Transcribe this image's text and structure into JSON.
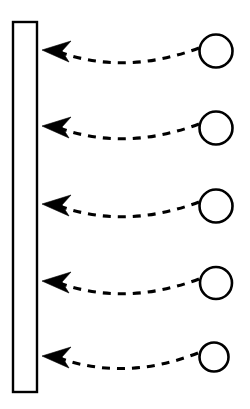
{
  "canvas": {
    "width": 250,
    "height": 409,
    "background_color": "#ffffff",
    "stroke_color": "#000000",
    "title": ""
  },
  "diagram": {
    "type": "flow-arrows",
    "bar": {
      "label": "",
      "x": 13,
      "y": 22,
      "width": 24,
      "height": 370,
      "stroke_width": 2.4,
      "fill_color": "#ffffff",
      "stroke_color": "#000000"
    },
    "nodes": [
      {
        "id": "node-1",
        "label": "",
        "cx": 216,
        "cy": 51,
        "r": 16.5,
        "stroke_width": 2.6,
        "fill_color": "#ffffff",
        "stroke_color": "#000000"
      },
      {
        "id": "node-2",
        "label": "",
        "cx": 216,
        "cy": 128,
        "r": 16.5,
        "stroke_width": 2.6,
        "fill_color": "#ffffff",
        "stroke_color": "#000000"
      },
      {
        "id": "node-3",
        "label": "",
        "cx": 216,
        "cy": 206,
        "r": 16.5,
        "stroke_width": 2.6,
        "fill_color": "#ffffff",
        "stroke_color": "#000000"
      },
      {
        "id": "node-4",
        "label": "",
        "cx": 216,
        "cy": 283,
        "r": 16.0,
        "stroke_width": 2.6,
        "fill_color": "#ffffff",
        "stroke_color": "#000000"
      },
      {
        "id": "node-5",
        "label": "",
        "cx": 214,
        "cy": 357,
        "r": 14.5,
        "stroke_width": 2.6,
        "fill_color": "#ffffff",
        "stroke_color": "#000000"
      }
    ],
    "arrows": [
      {
        "id": "arrow-1",
        "label": "",
        "from_node": "node-1",
        "to": "bar",
        "start_x": 199,
        "start_y": 48,
        "ctrl_x": 124,
        "ctrl_y": 76,
        "end_x": 56,
        "end_y": 51,
        "tip_x": 42,
        "tip_y": 50,
        "style": "dashed",
        "direction": "right-to-left"
      },
      {
        "id": "arrow-2",
        "label": "",
        "from_node": "node-2",
        "to": "bar",
        "start_x": 199,
        "start_y": 124,
        "ctrl_x": 124,
        "ctrl_y": 152,
        "end_x": 56,
        "end_y": 127,
        "tip_x": 42,
        "tip_y": 126,
        "style": "dashed",
        "direction": "right-to-left"
      },
      {
        "id": "arrow-3",
        "label": "",
        "from_node": "node-3",
        "to": "bar",
        "start_x": 199,
        "start_y": 202,
        "ctrl_x": 124,
        "ctrl_y": 230,
        "end_x": 56,
        "end_y": 205,
        "tip_x": 42,
        "tip_y": 204,
        "style": "dashed",
        "direction": "right-to-left"
      },
      {
        "id": "arrow-4",
        "label": "",
        "from_node": "node-4",
        "to": "bar",
        "start_x": 199,
        "start_y": 279,
        "ctrl_x": 124,
        "ctrl_y": 307,
        "end_x": 56,
        "end_y": 282,
        "tip_x": 42,
        "tip_y": 281,
        "style": "dashed",
        "direction": "right-to-left"
      },
      {
        "id": "arrow-5",
        "label": "",
        "from_node": "node-5",
        "to": "bar",
        "start_x": 198,
        "start_y": 353,
        "ctrl_x": 124,
        "ctrl_y": 382,
        "end_x": 56,
        "end_y": 357,
        "tip_x": 42,
        "tip_y": 356,
        "style": "dashed",
        "direction": "right-to-left"
      }
    ],
    "stroke": {
      "dash_length": 8,
      "dash_gap": 7,
      "line_width": 3.1,
      "arrowhead_style": "solid-barbed"
    }
  }
}
